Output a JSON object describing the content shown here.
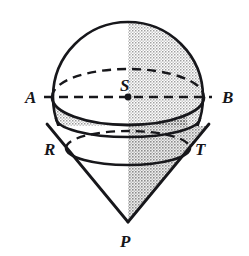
{
  "figure": {
    "canvas": {
      "width": 249,
      "height": 256,
      "background": "#ffffff"
    },
    "style": {
      "outline_color": "#17171b",
      "outline_width": 2.6,
      "dash_color": "#17171b",
      "dash_pattern": "9 6",
      "shade_light": "#d8d8d8",
      "shade_dark": "#b4b4b4",
      "white": "#ffffff",
      "label_color": "#16161a"
    },
    "labels": [
      {
        "id": "A",
        "text": "A",
        "x": 25,
        "y": 103,
        "role": "left end of horizontal great circle"
      },
      {
        "id": "B",
        "text": "B",
        "x": 222,
        "y": 103,
        "role": "right end of horizontal great circle"
      },
      {
        "id": "S",
        "text": "S",
        "x": 120,
        "y": 91,
        "role": "centre of sphere"
      },
      {
        "id": "R",
        "text": "R",
        "x": 44,
        "y": 155,
        "role": "left tangency point of cone and sphere"
      },
      {
        "id": "T",
        "text": "T",
        "x": 195,
        "y": 155,
        "role": "right tangency point of cone and sphere"
      },
      {
        "id": "P",
        "text": "P",
        "x": 120,
        "y": 247,
        "role": "apex of cone"
      }
    ],
    "geometry": {
      "sphere": {
        "cx": 128,
        "cy": 97,
        "r": 75
      },
      "centre_dot": {
        "cx": 128,
        "cy": 97,
        "r": 3.2
      },
      "great_circle_AB": {
        "cx": 128,
        "cy": 97,
        "rx": 76,
        "ry": 28,
        "front_arc": "visible solid (dips below)",
        "back_arc": "dashed",
        "chord_dashed": {
          "x1": 40,
          "y1": 97,
          "x2": 216,
          "y2": 97
        }
      },
      "tangency_circle_RT": {
        "cx": 128,
        "cy": 148,
        "rx": 62,
        "ry": 17,
        "front_arc": "solid",
        "back_arc": "dashed"
      },
      "upper_band_circle": {
        "cx": 128,
        "cy": 126,
        "rx": 72,
        "ry": 19
      },
      "cone": {
        "apex_x": 128,
        "apex_y": 222,
        "left_x": 47,
        "left_y": 126,
        "right_x": 209,
        "right_y": 126
      }
    }
  }
}
